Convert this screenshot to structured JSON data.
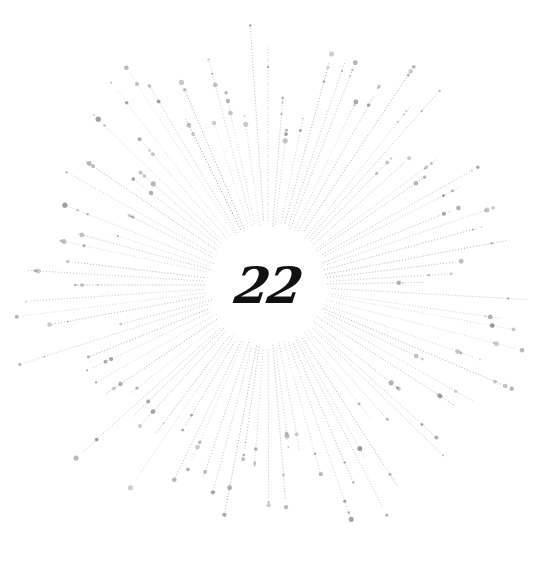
{
  "graphic": {
    "type": "sunburst",
    "center_number": "22",
    "center": [
      268,
      285
    ],
    "inner_radius": 58,
    "ray_color": "#9a9a9a",
    "dot_color": "#8a8a8a",
    "text_color": "#111111",
    "ray_count": 96
  }
}
